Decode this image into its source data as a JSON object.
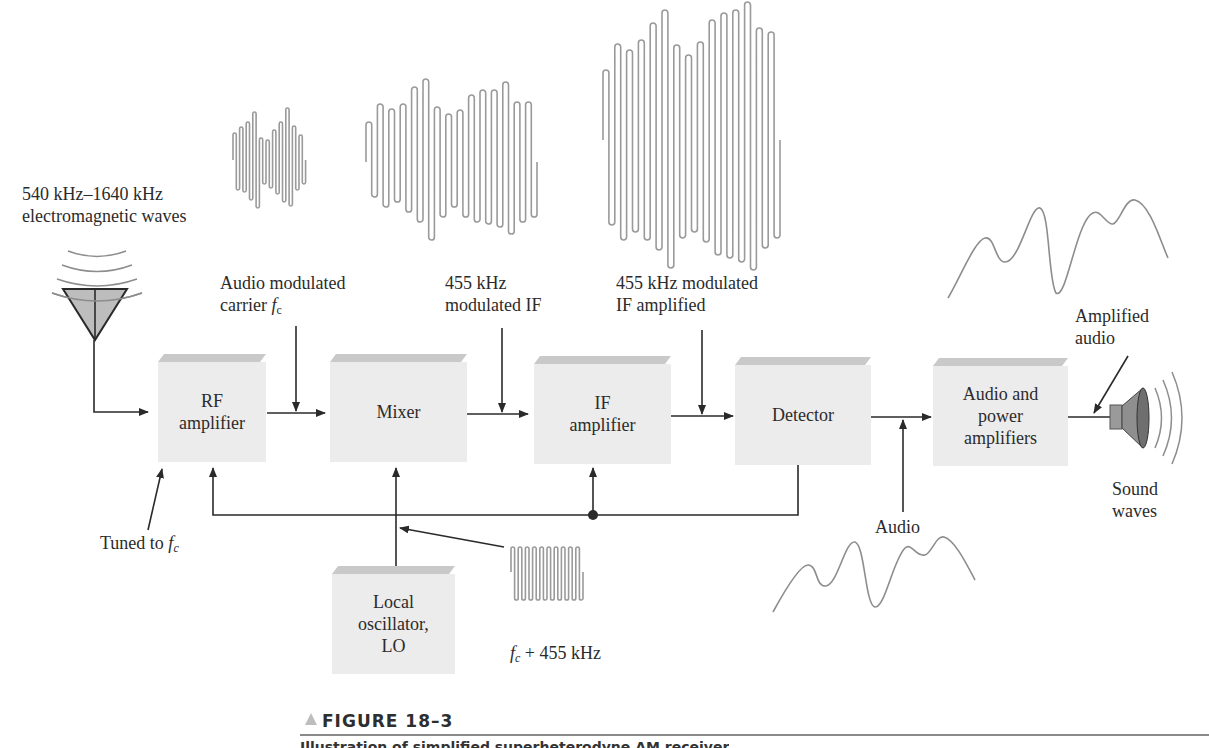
{
  "figure": {
    "title": "FIGURE 18–3",
    "caption_partial": "Illustration of simplified superheterodyne AM receiver"
  },
  "input_label": {
    "line1": "540 kHz–1640 kHz",
    "line2": "electromagnetic waves"
  },
  "signal_labels": {
    "audio_modulated_carrier": {
      "line1": "Audio modulated",
      "line2_prefix": "carrier ",
      "symbol": "f",
      "subscript": "c"
    },
    "modulated_if": {
      "line1": "455 kHz",
      "line2": "modulated IF"
    },
    "if_amplified": {
      "line1": "455 kHz modulated",
      "line2": "IF amplified"
    },
    "amplified_audio": {
      "line1": "Amplified",
      "line2": "audio"
    },
    "tuned_to": {
      "prefix": "Tuned to ",
      "symbol": "f",
      "subscript": "c"
    },
    "audio": "Audio",
    "lo_freq": {
      "symbol": "f",
      "subscript": "c",
      "suffix": " + 455 kHz"
    },
    "sound_waves": {
      "line1": "Sound",
      "line2": "waves"
    }
  },
  "blocks": [
    {
      "id": "rf",
      "line1": "RF",
      "line2": "amplifier"
    },
    {
      "id": "mixer",
      "line1": "Mixer",
      "line2": ""
    },
    {
      "id": "if",
      "line1": "IF",
      "line2": "amplifier"
    },
    {
      "id": "detector",
      "line1": "Detector",
      "line2": ""
    },
    {
      "id": "audio",
      "line1": "Audio and",
      "line2": "power",
      "line3": "amplifiers"
    },
    {
      "id": "lo",
      "line1": "Local",
      "line2": "oscillator,",
      "line3": "LO"
    }
  ],
  "icons": {
    "antenna": "antenna-icon",
    "speaker": "speaker-icon"
  },
  "colors": {
    "block_face": "#ececec",
    "block_top": "#c9c9c9",
    "line": "#2a2a2a",
    "waveform": "#9a9a9a",
    "antenna_fill": "#bdbdbd"
  }
}
